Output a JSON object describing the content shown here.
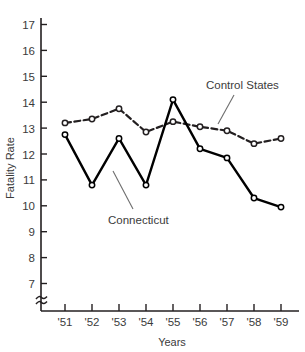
{
  "chart_data": {
    "type": "line",
    "title": "",
    "xlabel": "Years",
    "ylabel": "Fatality Rate",
    "x": [
      "'51",
      "'52",
      "'53",
      "'54",
      "'55",
      "'56",
      "'57",
      "'58",
      "'59"
    ],
    "categories": [
      "'51",
      "'52",
      "'53",
      "'54",
      "'55",
      "'56",
      "'57",
      "'58",
      "'59"
    ],
    "xlim": [
      "'51",
      "'59"
    ],
    "ylim": [
      7,
      17
    ],
    "yticks": [
      7,
      8,
      9,
      10,
      11,
      12,
      13,
      14,
      15,
      16,
      17
    ],
    "ytick_labels": [
      "7",
      "8",
      "9",
      "10",
      "11",
      "12",
      "13",
      "14",
      "15",
      "16",
      "17"
    ],
    "xtick_labels": [
      "'51",
      "'52",
      "'53",
      "'54",
      "'55",
      "'56",
      "'57",
      "'58",
      "'59"
    ],
    "grid": false,
    "legend": "inline-annotations",
    "axis_break": true,
    "axis_break_symbol": "≈",
    "series": [
      {
        "name": "Control States",
        "line_style": "dashed",
        "marker": "open-circle",
        "color": "#231f20",
        "values": [
          13.2,
          13.35,
          13.75,
          12.85,
          13.25,
          13.05,
          12.9,
          12.4,
          12.6
        ]
      },
      {
        "name": "Connecticut",
        "line_style": "solid",
        "marker": "open-circle",
        "color": "#000000",
        "values": [
          12.75,
          10.8,
          12.6,
          10.8,
          14.1,
          12.2,
          11.85,
          10.3,
          9.95
        ]
      }
    ],
    "annotations": [
      {
        "text": "Control States",
        "series": "Control States"
      },
      {
        "text": "Connecticut",
        "series": "Connecticut"
      }
    ]
  },
  "axes": {
    "y_title": "Fatality Rate",
    "x_title": "Years"
  },
  "annotations": {
    "control_states": "Control States",
    "connecticut": "Connecticut"
  },
  "colors": {
    "ink": "#231f20",
    "line": "#000000",
    "leader": "#6d6d6d",
    "background": "#ffffff"
  }
}
